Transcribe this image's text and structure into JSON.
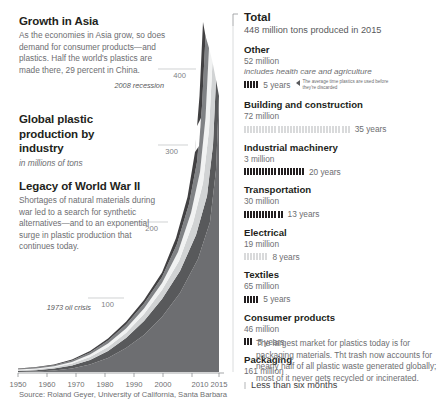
{
  "left": {
    "blocks": [
      {
        "title": "Growth in Asia",
        "body": "As the economies in Asia grow, so does demand for consumer products—and plastics. Half the world's plastics are made there, 29 percent in China."
      },
      {
        "title": "Global plastic production by industry",
        "sub": "in millions of tons"
      },
      {
        "title": "Legacy of World War II",
        "body": "Shortages of natural materials during war led to a search for synthetic alternatives—and to an exponential surge in plastic production that continues today."
      }
    ],
    "source": "Source: Roland Geyer, University of California, Santa Barbara"
  },
  "chart_data": {
    "type": "area",
    "title": "Global plastic production by industry",
    "subtitle": "in millions of tons",
    "xlabel": "",
    "ylabel": "millions of tons",
    "xlim": [
      1950,
      2015
    ],
    "ylim": [
      0,
      448
    ],
    "ytick_labels": [
      "100",
      "200",
      "300",
      "400"
    ],
    "yticks": [
      100,
      200,
      300,
      400
    ],
    "xtick_labels": [
      "1950",
      "1960",
      "1970",
      "1980",
      "1990",
      "2000",
      "2010",
      "2015"
    ],
    "xticks": [
      1950,
      1960,
      1970,
      1980,
      1990,
      2000,
      2010,
      2015
    ],
    "grid": true,
    "legend": "none",
    "annotations": [
      {
        "text": "2008 recession",
        "x": 2008,
        "y": 330
      },
      {
        "text": "1973 oil crisis",
        "x": 1973,
        "y": 95
      }
    ],
    "x": [
      1950,
      1955,
      1960,
      1965,
      1970,
      1975,
      1980,
      1985,
      1990,
      1995,
      2000,
      2005,
      2010,
      2015
    ],
    "series": [
      {
        "name": "Packaging",
        "values": [
          0.5,
          1.5,
          3,
          7,
          14,
          22,
          35,
          48,
          65,
          85,
          105,
          125,
          145,
          161
        ]
      },
      {
        "name": "Building and construction",
        "values": [
          0.3,
          0.8,
          2,
          4,
          8,
          12,
          18,
          25,
          32,
          40,
          48,
          57,
          65,
          72
        ]
      },
      {
        "name": "Textiles",
        "values": [
          0.2,
          0.6,
          1.5,
          3,
          6,
          10,
          15,
          21,
          28,
          35,
          42,
          50,
          58,
          65
        ]
      },
      {
        "name": "Other",
        "values": [
          0.2,
          0.5,
          1.2,
          2.5,
          5,
          8,
          12,
          17,
          22,
          28,
          34,
          41,
          47,
          52
        ]
      },
      {
        "name": "Consumer products",
        "values": [
          0.2,
          0.4,
          1,
          2,
          4,
          7,
          11,
          15,
          20,
          25,
          30,
          36,
          42,
          46
        ]
      },
      {
        "name": "Transportation",
        "values": [
          0.1,
          0.3,
          0.7,
          1.5,
          3,
          5,
          7,
          10,
          13,
          16,
          20,
          24,
          27,
          30
        ]
      },
      {
        "name": "Electrical",
        "values": [
          0.1,
          0.2,
          0.5,
          1,
          2,
          3,
          4.5,
          6,
          8,
          10,
          12,
          15,
          17,
          19
        ]
      },
      {
        "name": "Industrial machinery",
        "values": [
          0.02,
          0.05,
          0.1,
          0.2,
          0.3,
          0.5,
          0.8,
          1.1,
          1.5,
          1.9,
          2.2,
          2.5,
          2.8,
          3
        ]
      }
    ],
    "total_values": [
      1.6,
      4.3,
      10,
      21.2,
      42.3,
      67.5,
      103.3,
      143.1,
      189.5,
      240.9,
      293.2,
      350.5,
      403.8,
      448
    ]
  },
  "right": {
    "total": {
      "name": "Total",
      "amount": "448 million tons produced in 2015"
    },
    "callout": "The average time plastics are used before they're discarded",
    "categories": [
      {
        "name": "Other",
        "amount": "52 million",
        "note": "includes health care and agriculture",
        "years_label": "5 years",
        "years": 5,
        "shade": "dark"
      },
      {
        "name": "Building and construction",
        "amount": "72 million",
        "note": "",
        "years_label": "35 years",
        "years": 35,
        "shade": "light"
      },
      {
        "name": "Industrial machinery",
        "amount": "3 million",
        "note": "",
        "years_label": "20 years",
        "years": 20,
        "shade": "dark"
      },
      {
        "name": "Transportation",
        "amount": "30 million",
        "note": "",
        "years_label": "13 years",
        "years": 13,
        "shade": "dark"
      },
      {
        "name": "Electrical",
        "amount": "19 million",
        "note": "",
        "years_label": "8 years",
        "years": 8,
        "shade": "light"
      },
      {
        "name": "Textiles",
        "amount": "65 million",
        "note": "",
        "years_label": "5 years",
        "years": 5,
        "shade": "dark"
      },
      {
        "name": "Consumer products",
        "amount": "46 million",
        "note": "",
        "years_label": "3 years",
        "years": 3,
        "shade": "dark"
      },
      {
        "name": "Packaging",
        "amount": "161 million",
        "note": "",
        "years_label": "Less than six months",
        "years": 1,
        "shade": "light",
        "big_years": true
      }
    ],
    "footer_note": "The largest market for plastics today is for packaging materials. Tht trash now accounts for nearly half of all plastic waste generated globally; most of it never gets recycled or incinerated."
  },
  "colors": {
    "band_dark": "#58595b",
    "band_mid": "#808285",
    "band_light": "#d1d3d4",
    "band_white": "#f1f2f2",
    "tick_dark": "#231f20",
    "tick_light": "#d9dadb",
    "text_dark": "#231f20",
    "text_body": "#6d6e71"
  }
}
